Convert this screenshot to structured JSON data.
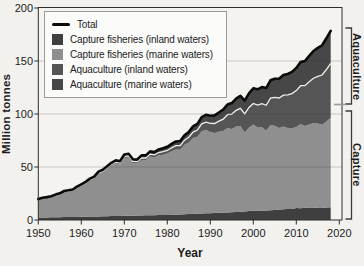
{
  "y_axis": {
    "title": "Million tonnes",
    "ticks": [
      0,
      50,
      100,
      150,
      200
    ]
  },
  "x_axis": {
    "title": "Year",
    "ticks": [
      1950,
      1960,
      1970,
      1980,
      1990,
      2000,
      2010,
      2020
    ]
  },
  "legend": {
    "total_label": "Total"
  },
  "colors": {
    "background": "#f2f1ee",
    "plot_background": "#f4f3f0",
    "frame": "#2e2e2e",
    "grid": "#c6c5c2",
    "total_line": "#0b0b0b",
    "separator_line": "#eeede9",
    "text": "#1c1c1c"
  },
  "chart_data": {
    "type": "area",
    "stacked": true,
    "title": "",
    "xlabel": "Year",
    "ylabel": "Million tonnes",
    "xlim": [
      1950,
      2020
    ],
    "ylim": [
      0,
      200
    ],
    "grid": "horizontal",
    "gridline_values": [
      50,
      100,
      150
    ],
    "legend_position": "upper-left",
    "x_start_year": 1950,
    "x_end_year": 2018,
    "x_step": 1,
    "unit": "million tonnes",
    "total": {
      "name": "Total",
      "color": "#0b0b0b"
    },
    "series": [
      {
        "name": "Capture fisheries (inland waters)",
        "color": "#3f3f3f",
        "values": [
          2.3,
          2.4,
          2.4,
          2.5,
          2.5,
          2.6,
          2.7,
          2.8,
          2.9,
          2.9,
          3.0,
          3.1,
          3.2,
          3.3,
          3.4,
          3.5,
          3.6,
          3.7,
          3.8,
          3.9,
          4.0,
          4.0,
          4.1,
          4.2,
          4.3,
          4.4,
          4.5,
          4.5,
          4.6,
          4.6,
          4.6,
          4.8,
          5.0,
          5.2,
          5.4,
          5.6,
          5.8,
          6.0,
          6.2,
          6.3,
          6.4,
          6.6,
          6.8,
          7.0,
          7.2,
          7.4,
          7.6,
          7.8,
          8.0,
          8.4,
          8.7,
          8.9,
          9.0,
          9.0,
          9.2,
          9.5,
          9.8,
          10.1,
          10.3,
          10.5,
          11.3,
          11.1,
          11.6,
          11.7,
          11.9,
          11.4,
          11.4,
          11.9,
          12.0
        ]
      },
      {
        "name": "Capture fisheries (marine waters)",
        "color": "#8f8f8f",
        "values": [
          16.8,
          18.0,
          18.5,
          19.0,
          20.5,
          21.5,
          23.5,
          24.0,
          24.5,
          27.0,
          29.0,
          31.0,
          34.0,
          35.5,
          40.0,
          41.5,
          44.5,
          47.5,
          49.5,
          48.5,
          54.5,
          55.0,
          49.5,
          49.0,
          52.5,
          52.0,
          55.5,
          54.5,
          56.5,
          57.0,
          58.0,
          60.0,
          61.5,
          61.0,
          65.5,
          67.5,
          71.5,
          72.5,
          77.5,
          78.5,
          76.5,
          75.5,
          76.5,
          77.0,
          79.5,
          78.5,
          80.5,
          81.0,
          74.5,
          79.0,
          81.5,
          78.5,
          78.5,
          75.5,
          80.5,
          79.5,
          77.0,
          78.0,
          76.5,
          76.0,
          76.5,
          79.5,
          77.0,
          78.5,
          79.5,
          79.5,
          78.5,
          81.0,
          84.4
        ]
      },
      {
        "name": "Aquaculture (inland waters)",
        "color": "#555555",
        "values": [
          0.3,
          0.35,
          0.4,
          0.45,
          0.5,
          0.55,
          0.6,
          0.65,
          0.7,
          0.75,
          0.8,
          0.85,
          0.9,
          1.0,
          1.05,
          1.1,
          1.2,
          1.3,
          1.35,
          1.4,
          1.5,
          1.6,
          1.7,
          1.8,
          1.9,
          2.1,
          2.2,
          2.4,
          2.6,
          2.8,
          3.0,
          3.3,
          3.6,
          4.0,
          4.4,
          5.0,
          5.6,
          6.3,
          7.0,
          7.6,
          8.2,
          8.9,
          9.9,
          11.2,
          12.6,
          14.0,
          15.4,
          16.6,
          17.7,
          18.8,
          19.8,
          21.0,
          22.3,
          23.7,
          25.2,
          26.8,
          28.3,
          29.7,
          31.2,
          32.7,
          34.3,
          36.1,
          38.1,
          40.2,
          42.4,
          44.7,
          46.9,
          49.1,
          51.3
        ]
      },
      {
        "name": "Aquaculture (marine waters)",
        "color": "#474747",
        "values": [
          0.3,
          0.32,
          0.35,
          0.4,
          0.45,
          0.5,
          0.55,
          0.6,
          0.7,
          0.8,
          0.9,
          0.95,
          1.0,
          1.1,
          1.2,
          1.3,
          1.4,
          1.5,
          1.6,
          1.7,
          1.8,
          1.9,
          2.0,
          2.1,
          2.2,
          2.4,
          2.5,
          2.7,
          2.9,
          3.2,
          3.5,
          3.7,
          4.0,
          4.3,
          4.6,
          5.0,
          5.4,
          5.9,
          6.4,
          6.8,
          7.3,
          7.7,
          8.2,
          8.9,
          9.7,
          10.4,
          11.0,
          11.7,
          12.4,
          13.3,
          14.2,
          14.9,
          15.6,
          16.2,
          16.9,
          17.5,
          18.2,
          18.9,
          19.7,
          20.5,
          21.4,
          22.3,
          23.3,
          24.4,
          25.6,
          26.8,
          28.0,
          29.4,
          30.8
        ]
      }
    ],
    "separator_line": {
      "after_series": "Aquaculture (inland waters)",
      "color": "#eeede9"
    },
    "right_brackets": [
      {
        "label": "Aquaculture",
        "span_values": [
          100,
          180
        ]
      },
      {
        "label": "Capture",
        "span_values": [
          0,
          100
        ]
      }
    ]
  }
}
